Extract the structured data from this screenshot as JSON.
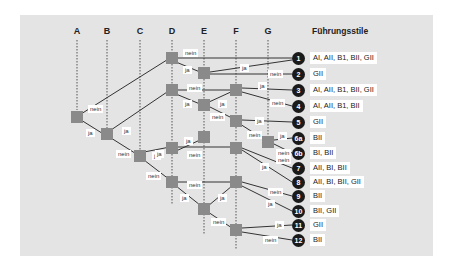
{
  "title": "Führungsstile",
  "columns": [
    {
      "label": "A",
      "x": 77
    },
    {
      "label": "B",
      "x": 107
    },
    {
      "label": "C",
      "x": 140
    },
    {
      "label": "D",
      "x": 172
    },
    {
      "label": "E",
      "x": 204
    },
    {
      "label": "F",
      "x": 236
    },
    {
      "label": "G",
      "x": 268
    }
  ],
  "branch_labels": {
    "yes": "ja",
    "no": "nein"
  },
  "outcomes": [
    {
      "id": "1",
      "styles": "AI, AII, B1, BII, GII"
    },
    {
      "id": "2",
      "styles": "GII"
    },
    {
      "id": "3",
      "styles": "AI, AII, B1, BII, GII"
    },
    {
      "id": "4",
      "styles": "AI, AII, B1, BII"
    },
    {
      "id": "5",
      "styles": "GII"
    },
    {
      "id": "6a",
      "styles": "BII"
    },
    {
      "id": "6b",
      "styles": "BI, BII"
    },
    {
      "id": "7",
      "styles": "AII, BI, BII"
    },
    {
      "id": "8",
      "styles": "AII, BI, BII, GII"
    },
    {
      "id": "9",
      "styles": "BII"
    },
    {
      "id": "10",
      "styles": "BII, GII"
    },
    {
      "id": "11",
      "styles": "GII"
    },
    {
      "id": "12",
      "styles": "BII"
    }
  ],
  "colors": {
    "panel": "#e4e4e4",
    "node": "#8a8a8a",
    "circle": "#1a1a1a",
    "line": "#333333"
  }
}
